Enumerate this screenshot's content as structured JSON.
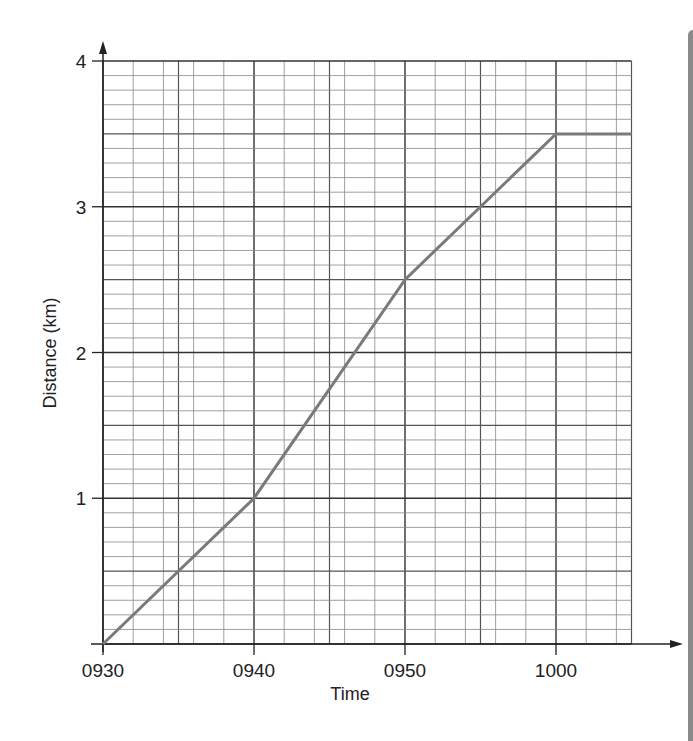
{
  "chart_data": {
    "type": "line",
    "title": "",
    "xlabel": "Time",
    "ylabel": "Distance (km)",
    "x_tick_labels": [
      "0930",
      "0940",
      "0950",
      "1000"
    ],
    "y_tick_labels": [
      "1",
      "2",
      "3",
      "4"
    ],
    "x_minutes_from_0930": [
      0,
      10,
      20,
      30,
      35
    ],
    "x": [
      "0930",
      "0940",
      "0950",
      "1000",
      "1005"
    ],
    "series": [
      {
        "name": "Distance",
        "values": [
          0,
          1,
          2.5,
          3.5,
          3.5
        ]
      }
    ],
    "xlim": [
      "0930",
      "1005"
    ],
    "ylim": [
      0,
      4
    ],
    "grid": {
      "on": true,
      "major_x_minutes": 10,
      "minor_x_minutes": 2,
      "major_y": 1,
      "minor_y": 0.1,
      "mid_y_lines": 0.5
    },
    "line_color": "#7a7a7a",
    "legend": null
  },
  "labels": {
    "xlabel": "Time",
    "ylabel": "Distance (km)",
    "x_ticks": [
      "0930",
      "0940",
      "0950",
      "1000"
    ],
    "y_ticks": [
      "1",
      "2",
      "3",
      "4"
    ]
  }
}
